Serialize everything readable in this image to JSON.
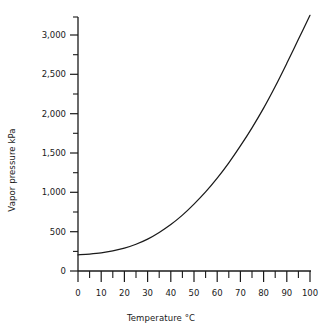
{
  "chart_data": {
    "type": "line",
    "title": "",
    "xlabel": "Temperature °C",
    "ylabel": "Vapor pressure kPa",
    "xlim": [
      0,
      102
    ],
    "ylim": [
      0,
      3300
    ],
    "grid": false,
    "legend": false,
    "line_color": "#1a1a1a",
    "x_ticks": [
      0,
      10,
      20,
      30,
      40,
      50,
      60,
      70,
      80,
      90,
      100
    ],
    "x_tick_labels": [
      "0",
      "10",
      "20",
      "30",
      "40",
      "50",
      "60",
      "70",
      "80",
      "90",
      "100"
    ],
    "x_minor_ticks": [
      5,
      15,
      25,
      35,
      45,
      55,
      65,
      75,
      85,
      95
    ],
    "y_ticks": [
      0,
      500,
      1000,
      1500,
      2000,
      2500,
      3000
    ],
    "y_tick_labels": [
      "0",
      "500",
      "1,000",
      "1,500",
      "2,000",
      "2,500",
      "3,000"
    ],
    "y_minor_ticks": [
      250,
      750,
      1250,
      1750,
      2250,
      2750,
      3250
    ],
    "x": [
      0,
      5,
      10,
      15,
      20,
      25,
      30,
      35,
      40,
      45,
      50,
      55,
      60,
      65,
      70,
      75,
      80,
      85,
      90,
      95,
      100
    ],
    "values": [
      205,
      215,
      230,
      255,
      290,
      340,
      405,
      490,
      590,
      710,
      850,
      1005,
      1180,
      1375,
      1590,
      1820,
      2070,
      2345,
      2640,
      2945,
      3250
    ],
    "series": [
      {
        "name": "Vapor pressure",
        "values": [
          205,
          215,
          230,
          255,
          290,
          340,
          405,
          490,
          590,
          710,
          850,
          1005,
          1180,
          1375,
          1590,
          1820,
          2070,
          2345,
          2640,
          2945,
          3250
        ]
      }
    ]
  },
  "axes": {
    "y_title": "Vapor pressure kPa",
    "x_title": "Temperature °C"
  },
  "y_tick_text": {
    "t0": "0",
    "t1": "500",
    "t2": "1,000",
    "t3": "1,500",
    "t4": "2,000",
    "t5": "2,500",
    "t6": "3,000"
  },
  "x_tick_text": {
    "t0": "0",
    "t1": "10",
    "t2": "20",
    "t3": "30",
    "t4": "40",
    "t5": "50",
    "t6": "60",
    "t7": "70",
    "t8": "80",
    "t9": "90",
    "t10": "100"
  }
}
